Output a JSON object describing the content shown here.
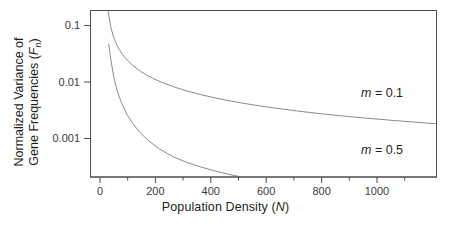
{
  "figure": {
    "background_color": "#ffffff",
    "axis_color": "#4d4d4d",
    "curve_color": "#8a8a8a",
    "text_color": "#231f20"
  },
  "chart_data": {
    "type": "line",
    "title": "",
    "subtitle": "",
    "xlabel": "Population Density (N)",
    "xlabel_parts": {
      "text": "Population Density (",
      "symbol": "N",
      "close": ")"
    },
    "ylabel": "Normalized Variance of Gene Frequencies (Fn)",
    "ylabel_line1": "Normalized Variance of",
    "ylabel_line2_prefix": "Gene Frequencies (",
    "ylabel_line2_symbol": "F",
    "ylabel_line2_subscript": "n",
    "ylabel_line2_suffix": ")",
    "xscale": "linear",
    "yscale": "log",
    "xlim": [
      -55,
      1215
    ],
    "ylim": [
      0.00014,
      0.175
    ],
    "grid": false,
    "legend_position": "inline-annotation",
    "xticks": [
      0,
      200,
      400,
      600,
      800,
      1000
    ],
    "xtick_labels": [
      "0",
      "200",
      "400",
      "600",
      "800",
      "1000"
    ],
    "x_minor_ticks": [
      100,
      300,
      500,
      700,
      900,
      1100
    ],
    "yticks": [
      0.1,
      0.01,
      0.001
    ],
    "ytick_labels": [
      "0.1",
      "0.01",
      "0.001"
    ],
    "series": [
      {
        "name": "m = 0.1",
        "label_math": "m",
        "label_value": "= 0.1",
        "annotation_text": "m = 0.1",
        "color": "#8a8a8a",
        "x": [
          5,
          10,
          20,
          30,
          40,
          50,
          60,
          80,
          100,
          125,
          150,
          175,
          200,
          250,
          300,
          350,
          400,
          450,
          500,
          550,
          600,
          650,
          700,
          750,
          800,
          850,
          900,
          950,
          1000,
          1060,
          1120,
          1180,
          1215
        ],
        "y": [
          0.333,
          0.1667,
          0.0833,
          0.0556,
          0.0417,
          0.0333,
          0.0278,
          0.0208,
          0.0167,
          0.0133,
          0.0111,
          0.00952,
          0.00833,
          0.00667,
          0.00556,
          0.00476,
          0.00417,
          0.0037,
          0.00333,
          0.00303,
          0.00278,
          0.00256,
          0.00238,
          0.00222,
          0.00208,
          0.00196,
          0.00185,
          0.00175,
          0.00167,
          0.00157,
          0.00149,
          0.00141,
          0.00137
        ]
      },
      {
        "name": "m = 0.5",
        "label_math": "m",
        "label_value": "= 0.5",
        "annotation_text": "m = 0.5",
        "color": "#8a8a8a",
        "x": [
          12,
          15,
          20,
          30,
          40,
          50,
          60,
          80,
          100,
          125,
          150,
          175,
          200,
          250,
          300,
          350,
          400,
          450,
          500,
          550,
          600,
          650,
          700,
          750,
          800,
          850,
          900,
          950,
          1000,
          1050
        ],
        "y": [
          0.042,
          0.0315,
          0.0205,
          0.0105,
          0.0064,
          0.0044,
          0.00325,
          0.00198,
          0.00139,
          0.00096,
          0.00072,
          0.00057,
          0.00046,
          0.00033,
          0.00026,
          0.000215,
          0.000182,
          0.000158,
          0.00014,
          0.000126,
          0.000114,
          0.000105,
          9.66e-05,
          9e-05,
          8.45e-05,
          7.95e-05,
          7.52e-05,
          7.13e-05,
          6.78e-05,
          6.46e-05
        ]
      }
    ],
    "annotations": [
      {
        "text": "m = 0.1",
        "x_px": 361,
        "y_px": 94
      },
      {
        "text": "m = 0.5",
        "x_px": 361,
        "y_px": 151
      }
    ]
  }
}
